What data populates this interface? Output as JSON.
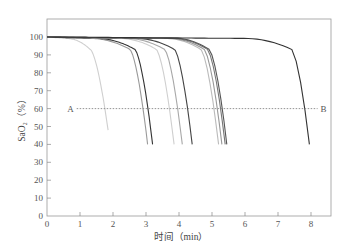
{
  "chart_data": {
    "type": "line",
    "title": "",
    "xlabel": "时间（min）",
    "ylabel": "SaO₂（%）",
    "xlim": [
      0,
      8.6
    ],
    "ylim": [
      0,
      110
    ],
    "xticks": [
      0,
      1,
      2,
      3,
      4,
      5,
      6,
      7,
      8
    ],
    "yticks": [
      0,
      10,
      20,
      30,
      40,
      50,
      60,
      70,
      80,
      90,
      100
    ],
    "grid": false,
    "legend": null,
    "reference_line": {
      "y": 60,
      "x_start": 0.9,
      "x_end": 8.2,
      "label_start": "A",
      "label_end": "B",
      "style": "dotted"
    },
    "series": [
      {
        "name": "curve-1",
        "color": "#cfcfcf",
        "drop_start": 0.6,
        "end_x": 1.85,
        "end_y": 48
      },
      {
        "name": "curve-2",
        "color": "#9a9a9a",
        "drop_start": 1.3,
        "end_x": 3.05,
        "end_y": 40
      },
      {
        "name": "curve-3",
        "color": "#333333",
        "drop_start": 1.5,
        "end_x": 3.2,
        "end_y": 40
      },
      {
        "name": "curve-4",
        "color": "#cfcfcf",
        "drop_start": 2.2,
        "end_x": 3.85,
        "end_y": 40
      },
      {
        "name": "curve-5",
        "color": "#a8a8a8",
        "drop_start": 2.4,
        "end_x": 4.1,
        "end_y": 40
      },
      {
        "name": "curve-6",
        "color": "#444444",
        "drop_start": 2.7,
        "end_x": 4.4,
        "end_y": 40
      },
      {
        "name": "curve-7",
        "color": "#bbbbbb",
        "drop_start": 3.6,
        "end_x": 5.2,
        "end_y": 40
      },
      {
        "name": "curve-8",
        "color": "#999999",
        "drop_start": 3.7,
        "end_x": 5.3,
        "end_y": 40
      },
      {
        "name": "curve-9",
        "color": "#777777",
        "drop_start": 3.8,
        "end_x": 5.4,
        "end_y": 40
      },
      {
        "name": "curve-10",
        "color": "#555555",
        "drop_start": 3.9,
        "end_x": 5.45,
        "end_y": 40
      },
      {
        "name": "curve-11",
        "color": "#333333",
        "drop_start": 6.0,
        "end_x": 7.95,
        "end_y": 40
      }
    ]
  }
}
